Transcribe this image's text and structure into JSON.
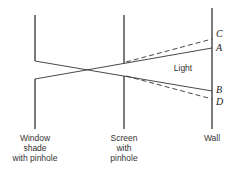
{
  "diagram": {
    "labels": {
      "window_shade": [
        "Window",
        "shade",
        "with pinhole"
      ],
      "screen": [
        "Screen",
        "with",
        "pinhole"
      ],
      "wall": "Wall",
      "light": "Light"
    },
    "points": {
      "A": "A",
      "B": "B",
      "C": "C",
      "D": "D"
    },
    "colors": {
      "line": "#333333",
      "text": "#333333"
    }
  }
}
